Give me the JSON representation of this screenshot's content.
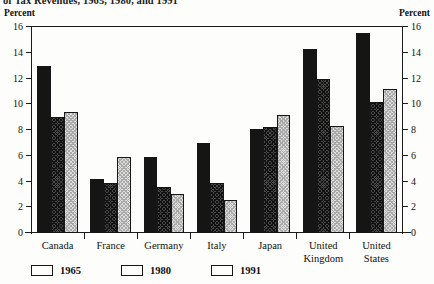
{
  "figure": {
    "title_truncated": "of Tax Revenues, 1965, 1980, and 1991",
    "left_axis_caption": "Percent",
    "right_axis_caption": "Percent"
  },
  "chart_data": {
    "type": "bar",
    "title": "of Tax Revenues, 1965, 1980, and 1991",
    "xlabel": "",
    "ylabel": "Percent",
    "ylim": [
      0,
      16
    ],
    "yticks": [
      0,
      2,
      4,
      6,
      8,
      10,
      12,
      14,
      16
    ],
    "grid": false,
    "legend_position": "bottom-left",
    "dual_axis": true,
    "categories": [
      "Canada",
      "France",
      "Germany",
      "Italy",
      "Japan",
      "United Kingdom",
      "United States"
    ],
    "series": [
      {
        "name": "1965",
        "color": "#151515",
        "pattern": "solid",
        "values": [
          13.0,
          4.2,
          5.9,
          7.0,
          8.1,
          14.3,
          15.5
        ]
      },
      {
        "name": "1980",
        "color": "#4a4a4a",
        "pattern": "crosshatch-dark",
        "values": [
          9.0,
          3.9,
          3.6,
          3.9,
          8.2,
          12.0,
          10.2
        ]
      },
      {
        "name": "1991",
        "color": "#dedede",
        "pattern": "stipple-light",
        "values": [
          9.4,
          5.9,
          3.0,
          2.6,
          9.2,
          8.3,
          11.2
        ]
      }
    ]
  }
}
